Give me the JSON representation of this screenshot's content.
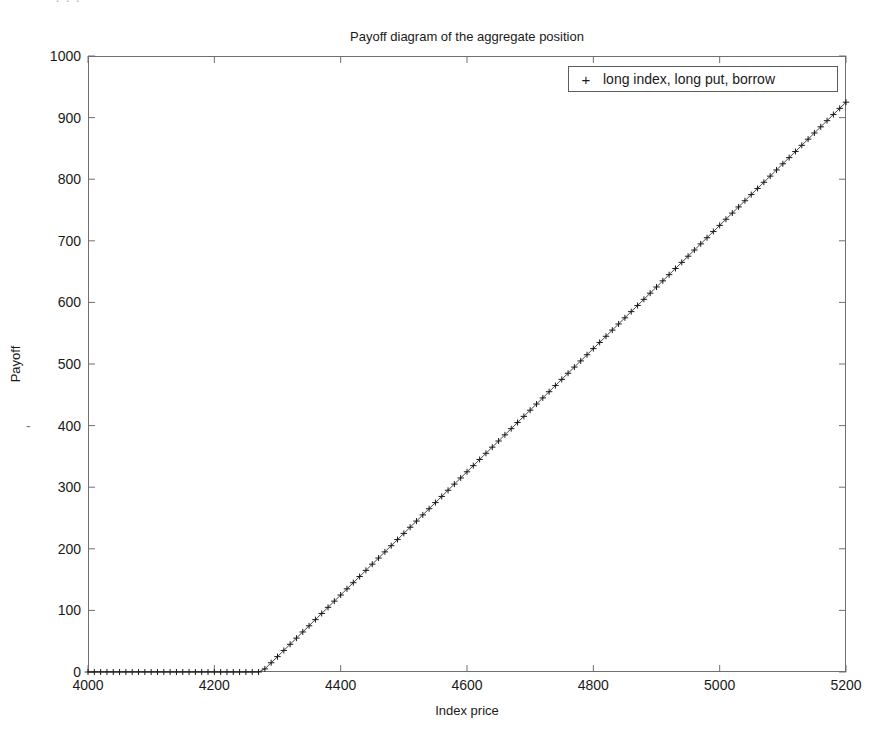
{
  "figure": {
    "scan_artifact_top": "· ·        ·",
    "title": "Payoff diagram of the aggregate position",
    "xaxis_label": "Index price",
    "yaxis_label": "Payoff",
    "yaxis_stray_dash": "-",
    "legend": {
      "marker": "+",
      "label": "long index, long put, borrow"
    },
    "colors": {
      "axis": "#6f6f6f",
      "series": "#1a1a1a",
      "background": "#ffffff",
      "legend_border": "#5c5c5c"
    }
  },
  "chart_data": {
    "type": "line",
    "title": "Payoff diagram of the aggregate position",
    "xlabel": "Index price",
    "ylabel": "Payoff",
    "xlim": [
      4000,
      5200
    ],
    "ylim": [
      0,
      1000
    ],
    "xticks": [
      4000,
      4200,
      4400,
      4600,
      4800,
      5000,
      5200
    ],
    "yticks": [
      0,
      100,
      200,
      300,
      400,
      500,
      600,
      700,
      800,
      900,
      1000
    ],
    "grid": false,
    "legend_position": "upper right",
    "marker": "+",
    "series": [
      {
        "name": "long index, long put, borrow",
        "marker": "+",
        "color": "#1a1a1a",
        "breakpoint_x": 4275,
        "slope_after_breakpoint": 1.0,
        "x": [
          4000,
          4010,
          4020,
          4030,
          4040,
          4050,
          4060,
          4070,
          4080,
          4090,
          4100,
          4110,
          4120,
          4130,
          4140,
          4150,
          4160,
          4170,
          4180,
          4190,
          4200,
          4210,
          4220,
          4230,
          4240,
          4250,
          4260,
          4270,
          4280,
          4290,
          4300,
          4310,
          4320,
          4330,
          4340,
          4350,
          4360,
          4370,
          4380,
          4390,
          4400,
          4410,
          4420,
          4430,
          4440,
          4450,
          4460,
          4470,
          4480,
          4490,
          4500,
          4510,
          4520,
          4530,
          4540,
          4550,
          4560,
          4570,
          4580,
          4590,
          4600,
          4610,
          4620,
          4630,
          4640,
          4650,
          4660,
          4670,
          4680,
          4690,
          4700,
          4710,
          4720,
          4730,
          4740,
          4750,
          4760,
          4770,
          4780,
          4790,
          4800,
          4810,
          4820,
          4830,
          4840,
          4850,
          4860,
          4870,
          4880,
          4890,
          4900,
          4910,
          4920,
          4930,
          4940,
          4950,
          4960,
          4970,
          4980,
          4990,
          5000,
          5010,
          5020,
          5030,
          5040,
          5050,
          5060,
          5070,
          5080,
          5090,
          5100,
          5110,
          5120,
          5130,
          5140,
          5150,
          5160,
          5170,
          5180,
          5190,
          5200
        ],
        "y": [
          0,
          0,
          0,
          0,
          0,
          0,
          0,
          0,
          0,
          0,
          0,
          0,
          0,
          0,
          0,
          0,
          0,
          0,
          0,
          0,
          0,
          0,
          0,
          0,
          0,
          0,
          0,
          0,
          5,
          15,
          25,
          35,
          45,
          55,
          65,
          75,
          85,
          95,
          105,
          115,
          125,
          135,
          145,
          155,
          165,
          175,
          185,
          195,
          205,
          215,
          225,
          235,
          245,
          255,
          265,
          275,
          285,
          295,
          305,
          315,
          325,
          335,
          345,
          355,
          365,
          375,
          385,
          395,
          405,
          415,
          425,
          435,
          445,
          455,
          465,
          475,
          485,
          495,
          505,
          515,
          525,
          535,
          545,
          555,
          565,
          575,
          585,
          595,
          605,
          615,
          625,
          635,
          645,
          655,
          665,
          675,
          685,
          695,
          705,
          715,
          725,
          735,
          745,
          755,
          765,
          775,
          785,
          795,
          805,
          815,
          825,
          835,
          845,
          855,
          865,
          875,
          885,
          895,
          905,
          915,
          925
        ]
      }
    ]
  }
}
